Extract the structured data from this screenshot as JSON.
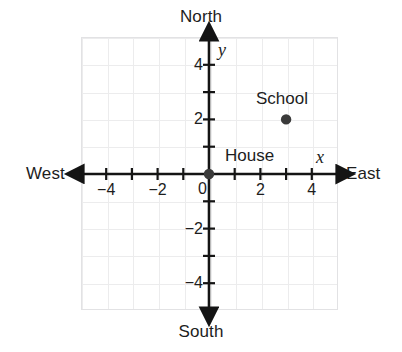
{
  "figure": {
    "compass": {
      "north": "North",
      "south": "South",
      "west": "West",
      "east": "East"
    },
    "axis_letters": {
      "x": "x",
      "y": "y"
    },
    "colors": {
      "grid_line": "#ececed",
      "grid_border": "#e2e2e4",
      "axis": "#141414",
      "point": "#3a3a3a",
      "text": "#1d1d1d",
      "background": "#ffffff"
    }
  },
  "chart_data": {
    "type": "scatter",
    "title": "",
    "xlabel": "x",
    "ylabel": "y",
    "xlim": [
      -5,
      5
    ],
    "ylim": [
      -5,
      5
    ],
    "grid": true,
    "grid_step": 1,
    "legend": "none",
    "x_tick_values": [
      -4,
      -2,
      0,
      2,
      4
    ],
    "x_tick_labels": [
      "−4",
      "−2",
      "0",
      "2",
      "4"
    ],
    "y_tick_values": [
      4,
      2,
      -2,
      -4
    ],
    "y_tick_labels": [
      "4",
      "2",
      "−2",
      "−4"
    ],
    "x_minor_ticks": [
      -5,
      -4,
      -3,
      -2,
      -1,
      1,
      2,
      3,
      4,
      5
    ],
    "y_minor_ticks": [
      5,
      4,
      3,
      2,
      1,
      -1,
      -2,
      -3,
      -4,
      -5
    ],
    "axis_arrows": [
      "left",
      "right",
      "up",
      "down"
    ],
    "points": [
      {
        "label": "House",
        "x": 0,
        "y": 0
      },
      {
        "label": "School",
        "x": 3,
        "y": 2
      }
    ],
    "annotations": [
      {
        "text": "North",
        "position": "top"
      },
      {
        "text": "South",
        "position": "bottom"
      },
      {
        "text": "West",
        "position": "left"
      },
      {
        "text": "East",
        "position": "right"
      }
    ]
  }
}
